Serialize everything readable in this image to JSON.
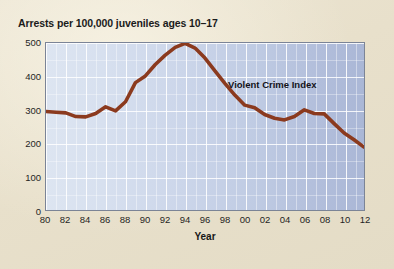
{
  "figure": {
    "title": "Arrests per 100,000 juveniles ages 10–17",
    "axis_title_x": "Year",
    "annotation": "Violent Crime Index",
    "paper_color": "#e9e1cd",
    "line_color": "#8b3a1e",
    "plot_fill_left": "#dde5f1",
    "plot_fill_right": "#aab7d6",
    "grid_color": "#ffffff",
    "frame_color": "#7b8496"
  },
  "chart_data": {
    "type": "line",
    "title": "Arrests per 100,000 juveniles ages 10–17",
    "xlabel": "Year",
    "ylabel": "",
    "xlim": [
      1980,
      2012
    ],
    "ylim": [
      0,
      500
    ],
    "grid": true,
    "legend": "none",
    "annotations": [
      {
        "text": "Violent Crime Index",
        "x": 2000,
        "y": 400
      }
    ],
    "y_ticks": [
      0,
      100,
      200,
      300,
      400,
      500
    ],
    "y_tick_labels": [
      "0",
      "100",
      "200",
      "300",
      "400",
      "500"
    ],
    "x_ticks": [
      1980,
      1982,
      1984,
      1986,
      1988,
      1990,
      1992,
      1994,
      1996,
      1998,
      2000,
      2002,
      2004,
      2006,
      2008,
      2010,
      2012
    ],
    "x_tick_labels": [
      "80",
      "82",
      "84",
      "86",
      "88",
      "90",
      "92",
      "94",
      "96",
      "98",
      "00",
      "02",
      "04",
      "06",
      "08",
      "10",
      "12"
    ],
    "series": [
      {
        "name": "Violent Crime Index",
        "color": "#8b3a1e",
        "x": [
          1980,
          1981,
          1982,
          1983,
          1984,
          1985,
          1986,
          1987,
          1988,
          1989,
          1990,
          1991,
          1992,
          1993,
          1994,
          1995,
          1996,
          1997,
          1998,
          1999,
          2000,
          2001,
          2002,
          2003,
          2004,
          2005,
          2006,
          2007,
          2008,
          2009,
          2010,
          2011,
          2012
        ],
        "values": [
          296,
          294,
          292,
          281,
          280,
          290,
          310,
          298,
          325,
          382,
          402,
          436,
          464,
          487,
          499,
          485,
          455,
          417,
          380,
          345,
          315,
          307,
          287,
          276,
          271,
          281,
          301,
          290,
          289,
          260,
          232,
          212,
          190
        ]
      }
    ]
  }
}
